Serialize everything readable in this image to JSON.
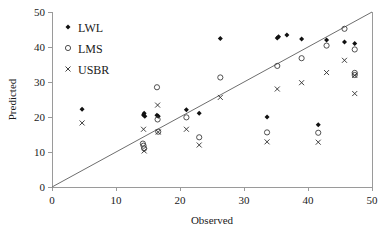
{
  "chart_data": {
    "type": "scatter",
    "title": "",
    "xlabel": "Observed",
    "ylabel": "Predicted",
    "xlim": [
      0,
      50
    ],
    "ylim": [
      0,
      50
    ],
    "xticks": [
      0,
      10,
      20,
      30,
      40,
      50
    ],
    "yticks": [
      0,
      10,
      20,
      30,
      40,
      50
    ],
    "grid": false,
    "legend_position": "top-left",
    "reference_line": {
      "name": "1:1 identity line",
      "from": [
        0,
        0
      ],
      "to": [
        50,
        50
      ]
    },
    "series": [
      {
        "name": "LWL",
        "marker": "filled-diamond",
        "color": "#111111",
        "points": [
          [
            4.7,
            22.2
          ],
          [
            14.3,
            20.6
          ],
          [
            14.4,
            21.1
          ],
          [
            14.5,
            20.2
          ],
          [
            16.4,
            20.5
          ],
          [
            16.6,
            20.2
          ],
          [
            21.0,
            22.1
          ],
          [
            23.0,
            21.1
          ],
          [
            26.3,
            42.4
          ],
          [
            33.6,
            20.0
          ],
          [
            35.2,
            42.6
          ],
          [
            35.4,
            42.9
          ],
          [
            36.7,
            43.4
          ],
          [
            39.0,
            42.3
          ],
          [
            41.6,
            17.8
          ],
          [
            42.9,
            42.0
          ],
          [
            45.7,
            41.4
          ],
          [
            47.3,
            41.0
          ]
        ]
      },
      {
        "name": "LMS",
        "marker": "open-circle",
        "color": "#3d3d3d",
        "points": [
          [
            14.2,
            12.4
          ],
          [
            14.3,
            11.8
          ],
          [
            14.4,
            11.0
          ],
          [
            16.4,
            28.5
          ],
          [
            16.5,
            19.3
          ],
          [
            16.6,
            15.8
          ],
          [
            21.0,
            19.9
          ],
          [
            23.0,
            14.2
          ],
          [
            26.3,
            31.3
          ],
          [
            33.6,
            15.6
          ],
          [
            35.2,
            34.6
          ],
          [
            39.0,
            36.8
          ],
          [
            42.9,
            40.4
          ],
          [
            41.6,
            15.5
          ],
          [
            45.7,
            45.2
          ],
          [
            47.3,
            39.3
          ],
          [
            47.3,
            32.6
          ],
          [
            47.3,
            32.0
          ]
        ]
      },
      {
        "name": "USBR",
        "marker": "cross-x",
        "color": "#2b2b2b",
        "points": [
          [
            4.7,
            18.3
          ],
          [
            14.3,
            16.5
          ],
          [
            14.4,
            10.3
          ],
          [
            16.5,
            23.4
          ],
          [
            16.6,
            15.7
          ],
          [
            21.0,
            16.5
          ],
          [
            23.0,
            12.0
          ],
          [
            26.3,
            25.6
          ],
          [
            33.6,
            12.9
          ],
          [
            35.2,
            28.0
          ],
          [
            39.0,
            29.8
          ],
          [
            41.6,
            12.8
          ],
          [
            42.9,
            32.7
          ],
          [
            45.7,
            36.2
          ],
          [
            47.3,
            31.9
          ],
          [
            47.3,
            26.7
          ]
        ]
      }
    ]
  },
  "legend": {
    "items": [
      {
        "label": "LWL",
        "marker": "filled-diamond"
      },
      {
        "label": "LMS",
        "marker": "open-circle"
      },
      {
        "label": "USBR",
        "marker": "cross-x"
      }
    ]
  },
  "axes": {
    "x_title": "Observed",
    "y_title": "Predicted",
    "x_tick_labels": [
      "0",
      "10",
      "20",
      "30",
      "40",
      "50"
    ],
    "y_tick_labels": [
      "0",
      "10",
      "20",
      "30",
      "40",
      "50"
    ]
  }
}
